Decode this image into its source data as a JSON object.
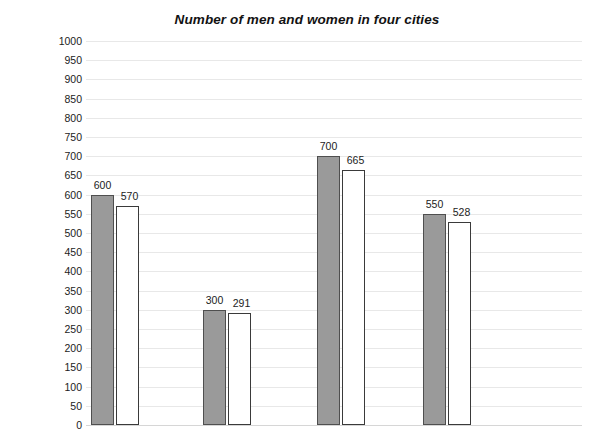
{
  "chart_data": {
    "type": "bar",
    "title": "Number of men and women in four cities",
    "xlabel": "",
    "ylabel": "NUMBER OF MEN AND WOMEN × 1000",
    "ylim": [
      0,
      1000
    ],
    "ytick_step": 50,
    "yticks": [
      "1000",
      "950",
      "900",
      "850",
      "800",
      "750",
      "700",
      "650",
      "600",
      "550",
      "500",
      "450",
      "400",
      "350",
      "300",
      "250",
      "200",
      "150",
      "100",
      "50",
      "0"
    ],
    "categories": [
      "City 1",
      "City 2",
      "City 3",
      "City 4"
    ],
    "category_labels_visible": false,
    "grid": true,
    "legend": false,
    "legend_position": "none",
    "series": [
      {
        "name": "Men",
        "color": "#9a9a9a",
        "values": [
          600,
          300,
          700,
          550
        ],
        "value_labels": [
          "600",
          "300",
          "700",
          "550"
        ]
      },
      {
        "name": "Women",
        "color": "#ffffff",
        "values": [
          570,
          291,
          665,
          528
        ],
        "value_labels": [
          "570",
          "291",
          "665",
          "528"
        ]
      }
    ]
  },
  "colors": {
    "men_fill": "#9a9a9a",
    "men_stroke": "#4f4f4f",
    "women_fill": "#ffffff",
    "women_stroke": "#3a3a3a",
    "gridline": "#e8e8e8",
    "baseline": "#d6d6d6",
    "text": "#1c1c1c",
    "background": "#ffffff"
  }
}
